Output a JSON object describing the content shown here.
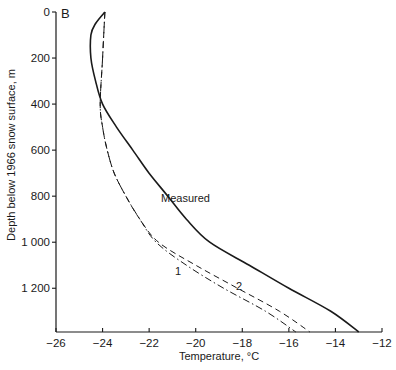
{
  "chart_data": {
    "type": "line",
    "panel_label": "B",
    "title": "",
    "xlabel": "Temperature, °C",
    "ylabel": "Depth below 1966 snow surface, m",
    "xlim": [
      -26,
      -12
    ],
    "ylim": [
      1390,
      0
    ],
    "y_inverted": true,
    "grid": false,
    "legend": "inline curve labels",
    "x_ticks": [
      -26,
      -24,
      -22,
      -20,
      -18,
      -16,
      -14,
      -12
    ],
    "x_tick_labels": [
      "-26",
      "-24",
      "-22",
      "-20",
      "-18",
      "-16",
      "-14",
      "-12"
    ],
    "y_ticks": [
      0,
      200,
      400,
      600,
      800,
      1000,
      1200
    ],
    "y_tick_labels": [
      "0",
      "200",
      "400",
      "600",
      "800",
      "1 000",
      "1 200"
    ],
    "series": [
      {
        "name": "Measured",
        "style": "solid",
        "depth": [
          0,
          50,
          100,
          200,
          300,
          400,
          500,
          600,
          700,
          800,
          900,
          1000,
          1100,
          1200,
          1300,
          1390
        ],
        "temperature": [
          -23.9,
          -24.3,
          -24.5,
          -24.5,
          -24.3,
          -24.0,
          -23.4,
          -22.7,
          -22.0,
          -21.2,
          -20.4,
          -19.4,
          -17.7,
          -16.0,
          -14.2,
          -13.0
        ]
      },
      {
        "name": "2",
        "style": "dashed",
        "depth": [
          0,
          200,
          400,
          500,
          600,
          700,
          800,
          900,
          1000,
          1100,
          1200,
          1300,
          1390
        ],
        "temperature": [
          -23.9,
          -24.0,
          -24.1,
          -24.0,
          -23.8,
          -23.5,
          -23.0,
          -22.4,
          -21.6,
          -20.0,
          -18.2,
          -16.4,
          -15.1
        ]
      },
      {
        "name": "1",
        "style": "dash-dot",
        "depth": [
          0,
          200,
          400,
          500,
          600,
          700,
          800,
          900,
          1000,
          1100,
          1200,
          1300,
          1390
        ],
        "temperature": [
          -23.9,
          -24.0,
          -24.1,
          -24.0,
          -23.8,
          -23.5,
          -23.0,
          -22.4,
          -21.7,
          -20.4,
          -18.8,
          -17.0,
          -15.7
        ]
      }
    ],
    "annotations": [
      {
        "text": "Measured",
        "near_depth": 820,
        "near_temperature": -20.5
      },
      {
        "text": "1",
        "near_depth": 1130,
        "near_temperature": -20.8
      },
      {
        "text": "2",
        "near_depth": 1190,
        "near_temperature": -18.2
      }
    ]
  }
}
